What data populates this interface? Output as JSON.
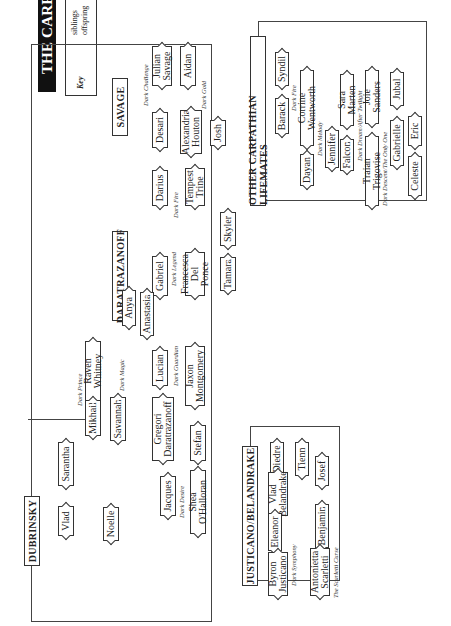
{
  "title": "THE CARPATHIANS",
  "key": {
    "label": "Key",
    "items": [
      "lifemates",
      "twins",
      "adopted children",
      "siblings",
      "offspring"
    ]
  },
  "families": {
    "savage": "SAVAGE",
    "daratrazanoff": "DARATRAZANOFF",
    "dubrinsky": "DUBRINSKY",
    "justicano": "JUSTICANO/BELANDRAKE",
    "others": "OTHER CARPATHIAN LIFEMATES"
  },
  "people": {
    "julian": "Julian Savage",
    "aidan": "Aidan",
    "desari": "Desari",
    "alexandria": "Alexandria Houton",
    "josh": "Josh",
    "darius": "Darius",
    "tempest": "Tempest Trine",
    "gabriel": "Gabriel",
    "francesca": "Francesca Del Ponce",
    "skyler": "Skyler",
    "tamara": "Tamara",
    "anya": "Anya",
    "anastasia": "Anastasia",
    "lucian": "Lucian",
    "jaxon": "Jaxon Montgomery",
    "gregori": "Gregori Daratrazanoff",
    "raven": "Raven Whitney",
    "mikhail": "Mikhail",
    "savannah": "Savannah",
    "sarantha": "Sarantha",
    "vlad_d": "Vlad",
    "noelle": "Noelle",
    "jacques": "Jacques",
    "shea": "Shea O'Halloran",
    "stefan": "Stefan",
    "barack": "Barack",
    "syndil": "Syndil",
    "dayan": "Dayan",
    "corrine": "Corrine Wentworth",
    "jennifer": "Jennifer",
    "falcon": "Falcon",
    "sara": "Sara Marten",
    "traian": "Traian Trigovise",
    "joie": "Joie Sanders",
    "gabrielle": "Gabrielle",
    "jubal": "Jubal",
    "celeste": "Celeste",
    "eric": "Eric",
    "diedre": "Diedre",
    "tienn": "Tienn",
    "vlad_b": "Vlad Belandrake",
    "josef": "Josef",
    "eleanor": "Eleanor",
    "benjamin": "Benjamin",
    "byron": "Byron Justicano",
    "antonietta": "Antonietta Scarletti"
  },
  "books": {
    "dark_challenge": "Dark Challenge",
    "dark_gold": "Dark Gold",
    "dark_fire": "Dark Fire",
    "dark_legend": "Dark Legend",
    "dark_guardian": "Dark Guardian",
    "dark_magic": "Dark Magic",
    "dark_prince": "Dark Prince",
    "dark_desire": "Dark Desire",
    "dark_fire_2": "Dark Fire",
    "dark_melody": "Dark Melody",
    "dark_dream": "Dark Dream/After Twilight",
    "dark_descent": "Dark Descent/The Only One",
    "dark_symphony": "Dark Symphony",
    "scarletti_curse": "The Scarletti Curse"
  }
}
